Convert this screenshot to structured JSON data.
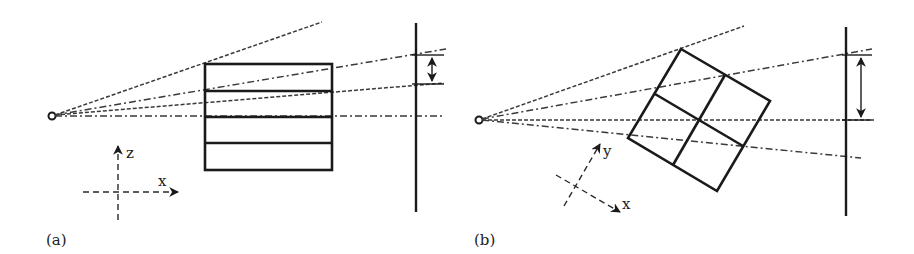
{
  "figure": {
    "panels": [
      {
        "id": "a",
        "label": "(a)",
        "axes": {
          "vertical": "z",
          "horizontal": "x"
        },
        "object": "rectangle divided into four horizontal slabs",
        "source_marker": "open circle (point source)"
      },
      {
        "id": "b",
        "label": "(b)",
        "axes": {
          "vertical": "y",
          "horizontal": "x"
        },
        "object": "rotated square divided into 2x2 grid",
        "source_marker": "open circle (point source)"
      }
    ],
    "colors": {
      "line": "#1a1a1a",
      "background": "#ffffff"
    }
  }
}
